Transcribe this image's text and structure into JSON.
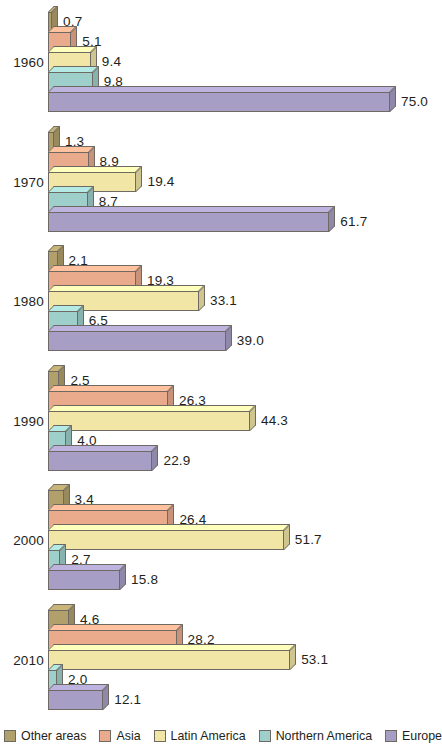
{
  "chart_data": {
    "type": "bar",
    "orientation": "horizontal",
    "title": "",
    "subtitle": "",
    "xlabel": "",
    "ylabel": "",
    "grid": false,
    "xlim": [
      0,
      75
    ],
    "legend_position": "bottom",
    "categories": [
      "1960",
      "1970",
      "1980",
      "1990",
      "2000",
      "2010"
    ],
    "series": [
      {
        "name": "Other areas¹",
        "color": "#b2a06c",
        "values": [
          0.7,
          1.3,
          2.1,
          2.5,
          3.4,
          4.6
        ]
      },
      {
        "name": "Asia",
        "color": "#e9ab8c",
        "values": [
          5.1,
          8.9,
          19.3,
          26.3,
          26.4,
          28.2
        ]
      },
      {
        "name": "Latin America",
        "color": "#f1e6a6",
        "values": [
          9.4,
          19.4,
          33.1,
          44.3,
          51.7,
          53.1
        ]
      },
      {
        "name": "Northern America",
        "color": "#9ecfca",
        "values": [
          9.8,
          8.7,
          6.5,
          4.0,
          2.7,
          2.0
        ]
      },
      {
        "name": "Europe",
        "color": "#a79ec5",
        "values": [
          75.0,
          61.7,
          39.0,
          22.9,
          15.8,
          12.1
        ]
      }
    ],
    "value_labels": [
      [
        "0.7",
        "5.1",
        "9.4",
        "9.8",
        "75.0"
      ],
      [
        "1.3",
        "8.9",
        "19.4",
        "8.7",
        "61.7"
      ],
      [
        "2.1",
        "19.3",
        "33.1",
        "6.5",
        "39.0"
      ],
      [
        "2.5",
        "26.3",
        "44.3",
        "4.0",
        "22.9"
      ],
      [
        "3.4",
        "26.4",
        "51.7",
        "2.7",
        "15.8"
      ],
      [
        "4.6",
        "28.2",
        "53.1",
        "2.0",
        "12.1"
      ]
    ]
  },
  "legend": {
    "items": [
      {
        "label": "Other areas",
        "superscript": "1",
        "color": "#b2a06c"
      },
      {
        "label": "Asia",
        "superscript": "",
        "color": "#e9ab8c"
      },
      {
        "label": "Latin America",
        "superscript": "",
        "color": "#f1e6a6"
      },
      {
        "label": "Northern America",
        "superscript": "",
        "color": "#9ecfca"
      },
      {
        "label": "Europe",
        "superscript": "",
        "color": "#a79ec5"
      }
    ]
  }
}
